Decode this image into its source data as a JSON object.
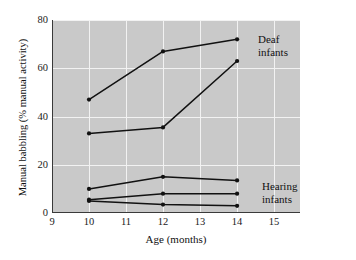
{
  "chart_data": {
    "type": "line",
    "title": "",
    "xlabel": "Age (months)",
    "ylabel": "Manual babbling (% manual activity)",
    "xlim": [
      9,
      15.7
    ],
    "ylim": [
      0,
      80
    ],
    "xticks": [
      9,
      10,
      11,
      12,
      13,
      14,
      15
    ],
    "yticks": [
      0,
      20,
      40,
      60,
      80
    ],
    "xtick_labels": [
      "9",
      "10",
      "11",
      "12",
      "13",
      "14",
      "15"
    ],
    "ytick_labels": [
      "0",
      "20",
      "40",
      "60",
      "80"
    ],
    "grid": true,
    "grid_color": "#f2f2f2",
    "plot_background": "#c9c9c9",
    "line_color": "#111111",
    "legend_position": "inline-annotation",
    "x": [
      10,
      12,
      14
    ],
    "groups": [
      {
        "name": "Deaf infants",
        "annotation": "Deaf\ninfants",
        "series": [
          {
            "name": "deaf-1",
            "values": [
              47,
              67,
              72
            ]
          },
          {
            "name": "deaf-2",
            "values": [
              33,
              35.5,
              63
            ]
          }
        ]
      },
      {
        "name": "Hearing infants",
        "annotation": "Hearing\ninfants",
        "series": [
          {
            "name": "hearing-1",
            "values": [
              10,
              15,
              13.5
            ]
          },
          {
            "name": "hearing-2",
            "values": [
              5.5,
              8,
              8
            ]
          },
          {
            "name": "hearing-3",
            "values": [
              5,
              3.5,
              3
            ]
          }
        ]
      }
    ]
  },
  "labels": {
    "deaf_line1": "Deaf",
    "deaf_line2": "infants",
    "hearing_line1": "Hearing",
    "hearing_line2": "infants",
    "x_axis_title": "Age (months)",
    "y_axis_title": "Manual babbling (% manual activity)"
  }
}
